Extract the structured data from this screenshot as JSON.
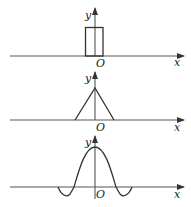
{
  "diagram": {
    "panels": [
      {
        "name": "rectangle-pulse",
        "x_label": "x",
        "y_label": "y",
        "origin_label": "O"
      },
      {
        "name": "triangle-pulse",
        "x_label": "x",
        "y_label": "y",
        "origin_label": "O"
      },
      {
        "name": "sinc-pulse",
        "x_label": "x",
        "y_label": "y",
        "origin_label": "O"
      }
    ],
    "colors": {
      "axis": "#555555",
      "curve": "#333333",
      "background": "#ffffff"
    }
  }
}
